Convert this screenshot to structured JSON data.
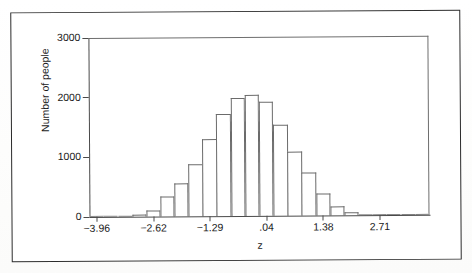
{
  "figure": {
    "kind": "scanned-statistics-figure",
    "border_color": "#2b2b2b",
    "axis_color": "#4a4a4a",
    "bar_outline_color": "#6b6b6b"
  },
  "chart_data": {
    "type": "bar",
    "title": "",
    "xlabel": "z",
    "ylabel": "Number of people",
    "ylim": [
      0,
      3000
    ],
    "yticks": [
      0,
      1000,
      2000,
      3000
    ],
    "ytick_labels": [
      "0",
      "1000",
      "2000",
      "3000"
    ],
    "xlim": [
      -4.13,
      3.88
    ],
    "xticks": [
      -3.96,
      -2.62,
      -1.29,
      0.04,
      1.38,
      2.71
    ],
    "xtick_labels": [
      "−3.96",
      "−2.62",
      "−1.29",
      ".04",
      "1.38",
      "2.71"
    ],
    "grid": false,
    "legend": null,
    "bin_width": 0.3338,
    "categories": [
      "-3.96",
      "-3.63",
      "-3.29",
      "-2.96",
      "-2.62",
      "-2.29",
      "-1.96",
      "-1.62",
      "-1.29",
      "-0.96",
      "-0.62",
      "-0.29",
      "0.04",
      "0.38",
      "0.71",
      "1.04",
      "1.38",
      "1.71",
      "2.04",
      "2.38",
      "2.71",
      "3.04",
      "3.38",
      "3.71"
    ],
    "values": [
      5,
      8,
      12,
      30,
      95,
      340,
      545,
      880,
      1295,
      1705,
      1975,
      2035,
      1910,
      1520,
      1070,
      720,
      370,
      150,
      55,
      25,
      12,
      8,
      5,
      3
    ],
    "peak_value": 2035,
    "peak_category": "0.04"
  }
}
